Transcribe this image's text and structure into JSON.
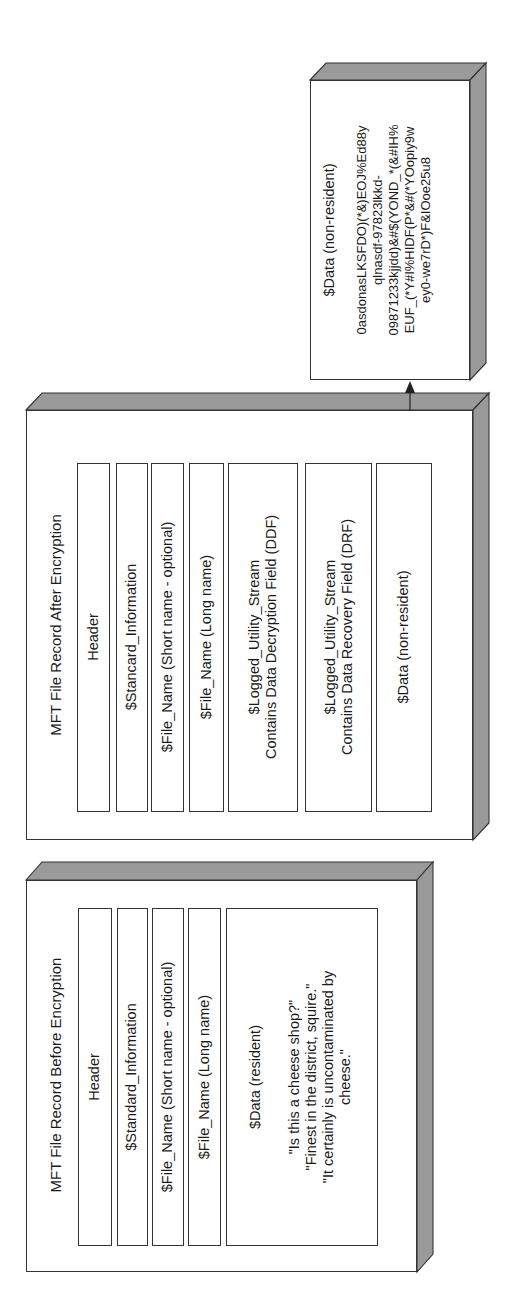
{
  "before": {
    "title": "MFT File Record Before Encryption",
    "fields": [
      {
        "label": "Header"
      },
      {
        "label": "$Standard_Information"
      },
      {
        "label": "$File_Name (Short name - optional)"
      },
      {
        "label": "$File_Name (Long name)"
      },
      {
        "label": "$Data (resident)",
        "content": "\"Is this a cheese shop?\"\n\"Finest in the district, squire.\"\n\"It certainly is uncontaminated by\ncheese.\""
      }
    ]
  },
  "after": {
    "title": "MFT File Record After Encryption",
    "fields": [
      {
        "label": "Header"
      },
      {
        "label": "$Stancard_Information"
      },
      {
        "label": "$File_Name (Short name - optional)"
      },
      {
        "label": "$File_Name (Long name)"
      },
      {
        "label": "$Logged_Utility_Stream\nContains Data Decryption Field (DDF)"
      },
      {
        "label": "$Logged_Utility_Stream\nContains Data Recovery Field (DRF)"
      },
      {
        "label": "$Data (non-resident)"
      }
    ]
  },
  "external_data": {
    "label": "$Data (non-resident)",
    "content": "0asdonasLKSFDO)(*&)EOJ%Ed88y\nqlnasdf-97823lkkd-\n09871233kjjdd)&#$(YOND_*(&#IH%\nEUF_(*Y#I%HIDF(P*&#(*YOopiy9w\ney0-we7rD*)F&IOoe25u8"
  },
  "colors": {
    "shade": "#9a9a9a",
    "outline": "#333333",
    "face": "#ffffff"
  }
}
